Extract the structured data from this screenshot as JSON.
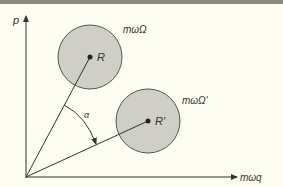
{
  "diagram": {
    "type": "phase-space",
    "axes": {
      "y_label": "p",
      "x_label": "mωq"
    },
    "circles": [
      {
        "center_label": "R",
        "region_label": "mωΩ"
      },
      {
        "center_label": "R′",
        "region_label": "mωΩ′"
      }
    ],
    "angle_label": "α",
    "colors": {
      "background": "#fdfdf2",
      "circle_fill": "#cfcfc7",
      "line": "#333333",
      "top_rule": "#8a8a80"
    }
  }
}
